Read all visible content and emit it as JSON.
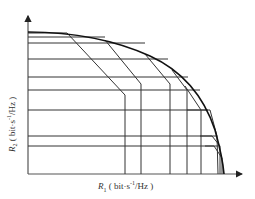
{
  "diagram": {
    "title": "",
    "x_axis": {
      "symbol": "R",
      "subscript": "1",
      "unit_pre": " ( bit·s",
      "unit_sup": "-1",
      "unit_post": "/Hz )"
    },
    "y_axis": {
      "symbol": "R",
      "subscript": "2",
      "unit_pre": " ( bit·s",
      "unit_sup": "-1",
      "unit_post": "/Hz )"
    },
    "colors": {
      "line": "#222222",
      "axis": "#555555",
      "background": "#ffffff"
    }
  }
}
